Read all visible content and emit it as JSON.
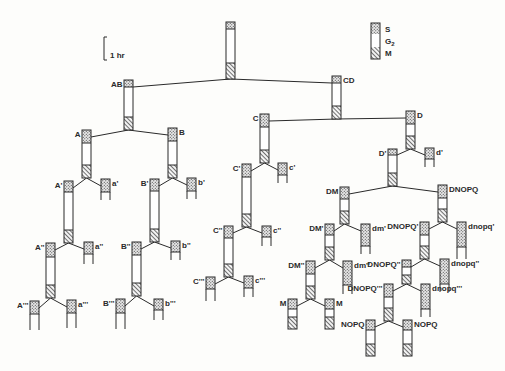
{
  "colors": {
    "ink": "#2a2a2a",
    "g2_fill": "#ffffff",
    "s_fill": "#dcdcdc",
    "background": "#fdfdfb"
  },
  "scale_bar": {
    "label": "1 hr",
    "x": 104,
    "y1": 37,
    "y2": 60
  },
  "legend": {
    "x": 371,
    "y": 23,
    "w": 9,
    "items": [
      {
        "phase": "S",
        "label": "S",
        "pattern": "stipple",
        "h": 11
      },
      {
        "phase": "G2",
        "label": "G",
        "sub": "2",
        "pattern": "blank",
        "h": 13
      },
      {
        "phase": "M",
        "label": "M",
        "pattern": "hatch",
        "h": 12
      }
    ]
  },
  "cells": [
    {
      "id": "root",
      "label": "",
      "x": 226,
      "top": 22,
      "s": 7,
      "g2": 34,
      "m": 16,
      "lp": "none"
    },
    {
      "id": "AB",
      "label": "AB",
      "x": 124,
      "top": 80,
      "s": 7,
      "g2": 30,
      "m": 13,
      "lp": "left"
    },
    {
      "id": "CD",
      "label": "CD",
      "x": 332,
      "top": 76,
      "s": 7,
      "g2": 23,
      "m": 13,
      "lp": "right"
    },
    {
      "id": "A",
      "label": "A",
      "x": 82,
      "top": 130,
      "s": 13,
      "g2": 22,
      "m": 13,
      "lp": "left"
    },
    {
      "id": "B",
      "label": "B",
      "x": 168,
      "top": 128,
      "s": 13,
      "g2": 24,
      "m": 13,
      "lp": "right"
    },
    {
      "id": "C",
      "label": "C",
      "x": 260,
      "top": 114,
      "s": 13,
      "g2": 23,
      "m": 13,
      "lp": "left"
    },
    {
      "id": "D",
      "label": "D",
      "x": 406,
      "top": 111,
      "s": 13,
      "g2": 12,
      "m": 13,
      "lp": "right"
    },
    {
      "id": "A1",
      "label": "A'",
      "x": 64,
      "top": 181,
      "s": 11,
      "g2": 38,
      "m": 13,
      "lp": "left"
    },
    {
      "id": "a1",
      "label": "a'",
      "x": 101,
      "top": 179,
      "s": 13,
      "g2": 0,
      "m": 0,
      "stub": 8,
      "lp": "right"
    },
    {
      "id": "B1",
      "label": "B'",
      "x": 150,
      "top": 179,
      "s": 12,
      "g2": 38,
      "m": 13,
      "lp": "left"
    },
    {
      "id": "b1",
      "label": "b'",
      "x": 187,
      "top": 178,
      "s": 13,
      "g2": 0,
      "m": 0,
      "stub": 8,
      "lp": "right"
    },
    {
      "id": "C1",
      "label": "C'",
      "x": 242,
      "top": 164,
      "s": 13,
      "g2": 37,
      "m": 13,
      "lp": "left"
    },
    {
      "id": "c1",
      "label": "c'",
      "x": 278,
      "top": 163,
      "s": 12,
      "g2": 0,
      "m": 0,
      "stub": 8,
      "lp": "right"
    },
    {
      "id": "D1",
      "label": "D'",
      "x": 388,
      "top": 149,
      "s": 6,
      "g2": 18,
      "m": 13,
      "lp": "left"
    },
    {
      "id": "d1",
      "label": "d'",
      "x": 425,
      "top": 148,
      "s": 11,
      "g2": 0,
      "m": 0,
      "stub": 8,
      "lp": "right"
    },
    {
      "id": "A2",
      "label": "A''",
      "x": 46,
      "top": 243,
      "s": 14,
      "g2": 28,
      "m": 13,
      "lp": "left"
    },
    {
      "id": "a2",
      "label": "a''",
      "x": 84,
      "top": 242,
      "s": 12,
      "g2": 0,
      "m": 0,
      "stub": 10,
      "lp": "right"
    },
    {
      "id": "B2",
      "label": "B''",
      "x": 132,
      "top": 242,
      "s": 13,
      "g2": 28,
      "m": 13,
      "lp": "left"
    },
    {
      "id": "b2",
      "label": "b''",
      "x": 171,
      "top": 241,
      "s": 11,
      "g2": 0,
      "m": 0,
      "stub": 8,
      "lp": "right"
    },
    {
      "id": "C2",
      "label": "C''",
      "x": 224,
      "top": 226,
      "s": 12,
      "g2": 26,
      "m": 13,
      "lp": "left"
    },
    {
      "id": "c2",
      "label": "c''",
      "x": 262,
      "top": 226,
      "s": 11,
      "g2": 0,
      "m": 0,
      "stub": 9,
      "lp": "right"
    },
    {
      "id": "DM",
      "label": "DM",
      "x": 340,
      "top": 187,
      "s": 12,
      "g2": 12,
      "m": 13,
      "lp": "left"
    },
    {
      "id": "DNOPQ",
      "label": "DNOPQ",
      "x": 438,
      "top": 185,
      "s": 13,
      "g2": 11,
      "m": 13,
      "lp": "right"
    },
    {
      "id": "A3",
      "label": "A'''",
      "x": 30,
      "top": 301,
      "s": 13,
      "g2": 0,
      "m": 0,
      "stub": 16,
      "lp": "left"
    },
    {
      "id": "a3",
      "label": "a'''",
      "x": 67,
      "top": 300,
      "s": 13,
      "g2": 0,
      "m": 0,
      "stub": 15,
      "lp": "right"
    },
    {
      "id": "B3",
      "label": "B'''",
      "x": 116,
      "top": 299,
      "s": 14,
      "g2": 0,
      "m": 0,
      "stub": 16,
      "lp": "left"
    },
    {
      "id": "b3",
      "label": "b'''",
      "x": 154,
      "top": 299,
      "s": 11,
      "g2": 0,
      "m": 0,
      "stub": 10,
      "lp": "right"
    },
    {
      "id": "C3",
      "label": "C'''",
      "x": 206,
      "top": 277,
      "s": 12,
      "g2": 0,
      "m": 0,
      "stub": 12,
      "lp": "left"
    },
    {
      "id": "c3",
      "label": "c'''",
      "x": 244,
      "top": 276,
      "s": 12,
      "g2": 0,
      "m": 0,
      "stub": 9,
      "lp": "right"
    },
    {
      "id": "DM1",
      "label": "DM'",
      "x": 325,
      "top": 224,
      "s": 11,
      "g2": 12,
      "m": 13,
      "lp": "left"
    },
    {
      "id": "dm1",
      "label": "dm'",
      "x": 361,
      "top": 224,
      "s": 22,
      "g2": 0,
      "m": 0,
      "stub": 8,
      "lp": "right"
    },
    {
      "id": "DM2",
      "label": "DM''",
      "x": 306,
      "top": 261,
      "s": 13,
      "g2": 12,
      "m": 13,
      "lp": "left"
    },
    {
      "id": "dm2",
      "label": "dm''",
      "x": 343,
      "top": 261,
      "s": 24,
      "g2": 0,
      "m": 0,
      "stub": 9,
      "lp": "right"
    },
    {
      "id": "M_left",
      "label": "M",
      "x": 288,
      "top": 299,
      "s": 10,
      "g2": 8,
      "m": 12,
      "lp": "left"
    },
    {
      "id": "M_right",
      "label": "M",
      "x": 325,
      "top": 299,
      "s": 10,
      "g2": 8,
      "m": 12,
      "lp": "right"
    },
    {
      "id": "DNOPQ1",
      "label": "DNOPQ'",
      "x": 420,
      "top": 222,
      "s": 13,
      "g2": 11,
      "m": 13,
      "lp": "left"
    },
    {
      "id": "dnopq1",
      "label": "dnopq'",
      "x": 457,
      "top": 222,
      "s": 25,
      "g2": 0,
      "m": 0,
      "stub": 12,
      "lp": "right"
    },
    {
      "id": "DNOPQ2",
      "label": "DNOPQ''",
      "x": 402,
      "top": 260,
      "s": 7,
      "g2": 8,
      "m": 9,
      "lp": "left"
    },
    {
      "id": "dnopq2",
      "label": "dnopq''",
      "x": 440,
      "top": 259,
      "s": 25,
      "g2": 0,
      "m": 0,
      "stub": 8,
      "lp": "right"
    },
    {
      "id": "DNOPQ3",
      "label": "DNOPQ'''",
      "x": 384,
      "top": 284,
      "s": 13,
      "g2": 11,
      "m": 13,
      "lp": "left"
    },
    {
      "id": "dnopq3",
      "label": "dnopq'''",
      "x": 421,
      "top": 284,
      "s": 25,
      "g2": 0,
      "m": 0,
      "stub": 8,
      "lp": "right"
    },
    {
      "id": "NOPQ_left",
      "label": "NOPQ",
      "x": 366,
      "top": 320,
      "s": 10,
      "g2": 14,
      "m": 12,
      "lp": "left"
    },
    {
      "id": "NOPQ_right",
      "label": "NOPQ",
      "x": 403,
      "top": 320,
      "s": 10,
      "g2": 14,
      "m": 12,
      "lp": "right"
    }
  ],
  "divisions": [
    {
      "parent": "root",
      "children": [
        "AB",
        "CD"
      ]
    },
    {
      "parent": "AB",
      "children": [
        "A",
        "B"
      ]
    },
    {
      "parent": "CD",
      "children": [
        "C",
        "D"
      ]
    },
    {
      "parent": "A",
      "children": [
        "A1",
        "a1"
      ]
    },
    {
      "parent": "B",
      "children": [
        "B1",
        "b1"
      ]
    },
    {
      "parent": "C",
      "children": [
        "C1",
        "c1"
      ]
    },
    {
      "parent": "D",
      "children": [
        "D1",
        "d1"
      ]
    },
    {
      "parent": "A1",
      "children": [
        "A2",
        "a2"
      ]
    },
    {
      "parent": "B1",
      "children": [
        "B2",
        "b2"
      ]
    },
    {
      "parent": "C1",
      "children": [
        "C2",
        "c2"
      ]
    },
    {
      "parent": "D1",
      "children": [
        "DM",
        "DNOPQ"
      ]
    },
    {
      "parent": "A2",
      "children": [
        "A3",
        "a3"
      ]
    },
    {
      "parent": "B2",
      "children": [
        "B3",
        "b3"
      ]
    },
    {
      "parent": "C2",
      "children": [
        "C3",
        "c3"
      ]
    },
    {
      "parent": "DM",
      "children": [
        "DM1",
        "dm1"
      ]
    },
    {
      "parent": "DM1",
      "children": [
        "DM2",
        "dm2"
      ]
    },
    {
      "parent": "DM2",
      "children": [
        "M_left",
        "M_right"
      ]
    },
    {
      "parent": "DNOPQ",
      "children": [
        "DNOPQ1",
        "dnopq1"
      ]
    },
    {
      "parent": "DNOPQ1",
      "children": [
        "DNOPQ2",
        "dnopq2"
      ]
    },
    {
      "parent": "DNOPQ2",
      "children": [
        "DNOPQ3",
        "dnopq3"
      ]
    },
    {
      "parent": "DNOPQ3",
      "children": [
        "NOPQ_left",
        "NOPQ_right"
      ]
    }
  ]
}
